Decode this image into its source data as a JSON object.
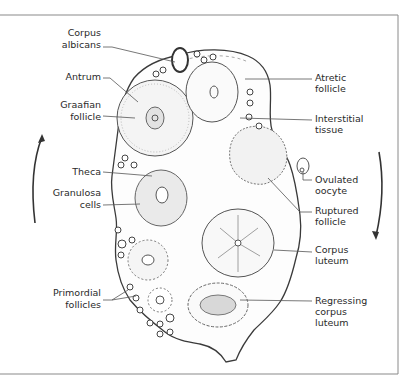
{
  "diagram": {
    "type": "anatomical-illustration",
    "colors": {
      "line": "#3a3a3a",
      "stipple": "#9a9a9a",
      "frame": "#8a8a8a",
      "background": "#ffffff"
    },
    "labels_left": [
      {
        "id": "corpus-albicans",
        "lines": [
          "Corpus",
          "albicans"
        ]
      },
      {
        "id": "antrum",
        "lines": [
          "Antrum"
        ]
      },
      {
        "id": "graafian-follicle",
        "lines": [
          "Graafian",
          "follicle"
        ]
      },
      {
        "id": "theca",
        "lines": [
          "Theca"
        ]
      },
      {
        "id": "granulosa-cells",
        "lines": [
          "Granulosa",
          "cells"
        ]
      },
      {
        "id": "primordial-follicles",
        "lines": [
          "Primordial",
          "follicles"
        ]
      }
    ],
    "labels_right": [
      {
        "id": "atretic-follicle",
        "lines": [
          "Atretic",
          "follicle"
        ]
      },
      {
        "id": "interstitial-tissue",
        "lines": [
          "Interstitial",
          "tissue"
        ]
      },
      {
        "id": "ovulated-oocyte",
        "lines": [
          "Ovulated",
          "oocyte"
        ]
      },
      {
        "id": "ruptured-follicle",
        "lines": [
          "Ruptured",
          "follicle"
        ]
      },
      {
        "id": "corpus-luteum",
        "lines": [
          "Corpus",
          "luteum"
        ]
      },
      {
        "id": "regressing-corpus-luteum",
        "lines": [
          "Regressing",
          "corpus",
          "luteum"
        ]
      }
    ],
    "arrows": [
      {
        "id": "left-arrow",
        "direction": "up",
        "meaning": "development cycle"
      },
      {
        "id": "right-arrow",
        "direction": "down",
        "meaning": "development cycle"
      }
    ]
  }
}
